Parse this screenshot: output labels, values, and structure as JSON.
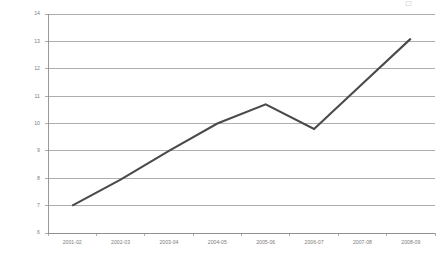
{
  "chart_data": {
    "type": "line",
    "title": "",
    "subtitle": "",
    "xlabel": "",
    "ylabel": "",
    "categories": [
      "2001-02",
      "2002-03",
      "2003-04",
      "2004-05",
      "2005-06",
      "2006-07",
      "2007-08",
      "2008-09"
    ],
    "values": [
      7.0,
      7.95,
      9.0,
      10.0,
      10.7,
      9.8,
      11.45,
      13.1
    ],
    "series": [
      {
        "name": "",
        "values": [
          7.0,
          7.95,
          9.0,
          10.0,
          10.7,
          9.8,
          11.45,
          13.1
        ]
      }
    ],
    "ylim": [
      6,
      14
    ],
    "yticks": [
      6,
      7,
      8,
      9,
      10,
      11,
      12,
      13,
      14
    ],
    "ytick_labels": [
      "6",
      "7",
      "8",
      "9",
      "10",
      "11",
      "12",
      "13",
      "14"
    ],
    "xtick_labels": [
      "2001-02",
      "2002-03",
      "2003-04",
      "2004-05",
      "2005-06",
      "2006-07",
      "2007-08",
      "2008-09"
    ],
    "grid": "horizontal",
    "legend": "none",
    "markers": "none",
    "annotations": [],
    "colors": {
      "line": "#4a4a4a",
      "gridline": "#9a9a9a",
      "axis": "#8e8e8e",
      "tick_text": "#7d7d7d",
      "background": "#ffffff"
    }
  },
  "plot_geometry": {
    "left": 48,
    "right": 435,
    "top": 14,
    "bottom": 233,
    "xtick_label_y": 240,
    "ytick_label_x": 40,
    "tick_length": 3
  }
}
